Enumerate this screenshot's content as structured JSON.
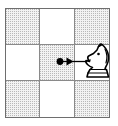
{
  "figure": {
    "title": "Knight move on a 3x3 board section",
    "board": {
      "rows": 3,
      "columns": 3,
      "light_color": "#ffffff",
      "shaded_color": "#f3f3f3",
      "grid_line_color": "#8a8a8a",
      "outer_border_color": "#6e6e6e",
      "cells": [
        {
          "id": "r1c1",
          "row": 1,
          "col": 1,
          "shading": "shaded"
        },
        {
          "id": "r1c2",
          "row": 1,
          "col": 2,
          "shading": "light"
        },
        {
          "id": "r1c3",
          "row": 1,
          "col": 3,
          "shading": "shaded"
        },
        {
          "id": "r2c1",
          "row": 2,
          "col": 1,
          "shading": "light"
        },
        {
          "id": "r2c2",
          "row": 2,
          "col": 2,
          "shading": "shaded"
        },
        {
          "id": "r2c3",
          "row": 2,
          "col": 3,
          "shading": "light"
        },
        {
          "id": "r3c1",
          "row": 3,
          "col": 1,
          "shading": "shaded"
        },
        {
          "id": "r3c2",
          "row": 3,
          "col": 2,
          "shading": "light"
        },
        {
          "id": "r3c3",
          "row": 3,
          "col": 3,
          "shading": "shaded"
        }
      ]
    },
    "annotation": {
      "origin_marker": "dot",
      "origin_cell": "r2c2",
      "arrow_direction": "right",
      "arrow_color": "#000000",
      "target_cell": "r2c3"
    },
    "piece": {
      "name": "knight",
      "color": "white",
      "outline_color": "#000000",
      "fill_color": "#ffffff",
      "facing": "right",
      "cell": "r2c3"
    }
  }
}
